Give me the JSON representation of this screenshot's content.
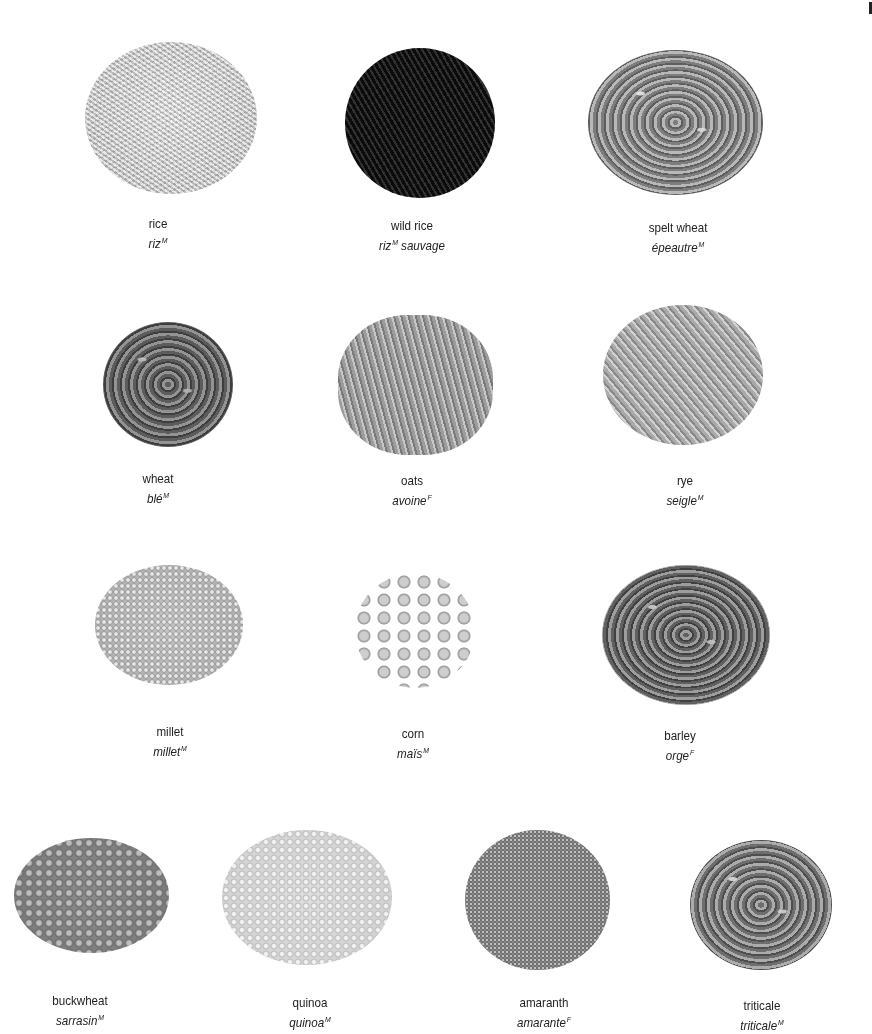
{
  "grains": [
    {
      "id": "rice",
      "english": "rice",
      "french": "riz",
      "french_suffix": "",
      "gender": "M"
    },
    {
      "id": "wild-rice",
      "english": "wild rice",
      "french": "riz",
      "french_suffix": " sauvage",
      "gender": "M"
    },
    {
      "id": "spelt",
      "english": "spelt wheat",
      "french": "épeautre",
      "french_suffix": "",
      "gender": "M"
    },
    {
      "id": "wheat",
      "english": "wheat",
      "french": "blé",
      "french_suffix": "",
      "gender": "M"
    },
    {
      "id": "oats",
      "english": "oats",
      "french": "avoine",
      "french_suffix": "",
      "gender": "F"
    },
    {
      "id": "rye",
      "english": "rye",
      "french": "seigle",
      "french_suffix": "",
      "gender": "M"
    },
    {
      "id": "millet",
      "english": "millet",
      "french": "millet",
      "french_suffix": "",
      "gender": "M"
    },
    {
      "id": "corn",
      "english": "corn",
      "french": "maïs",
      "french_suffix": "",
      "gender": "M"
    },
    {
      "id": "barley",
      "english": "barley",
      "french": "orge",
      "french_suffix": "",
      "gender": "F"
    },
    {
      "id": "buckwheat",
      "english": "buckwheat",
      "french": "sarrasin",
      "french_suffix": "",
      "gender": "M"
    },
    {
      "id": "quinoa",
      "english": "quinoa",
      "french": "quinoa",
      "french_suffix": "",
      "gender": "M"
    },
    {
      "id": "amaranth",
      "english": "amaranth",
      "french": "amarante",
      "french_suffix": "",
      "gender": "F"
    },
    {
      "id": "triticale",
      "english": "triticale",
      "french": "triticale",
      "french_suffix": "",
      "gender": "M"
    }
  ]
}
